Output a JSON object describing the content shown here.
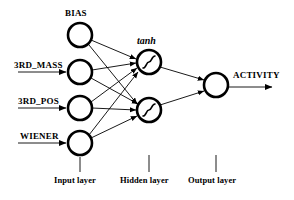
{
  "diagram": {
    "title_labels": {
      "bias": "BIAS",
      "tanh": "tanh",
      "activity": "ACTIVITY"
    },
    "inputs": [
      {
        "id": "bias",
        "label": "BIAS",
        "label_position": "above",
        "has_arrow": false,
        "cx": 80,
        "cy": 35
      },
      {
        "id": "3rd_mass",
        "label": "3RD_MASS",
        "label_position": "left",
        "has_arrow": true,
        "cx": 80,
        "cy": 72
      },
      {
        "id": "3rd_pos",
        "label": "3RD_POS",
        "label_position": "left",
        "has_arrow": true,
        "cx": 80,
        "cy": 108
      },
      {
        "id": "wiener",
        "label": "WIENER",
        "label_position": "left",
        "has_arrow": true,
        "cx": 80,
        "cy": 143
      }
    ],
    "hidden": [
      {
        "id": "h1",
        "activation": "tanh",
        "cx": 149,
        "cy": 62
      },
      {
        "id": "h2",
        "activation": "tanh",
        "cx": 149,
        "cy": 110
      }
    ],
    "output": [
      {
        "id": "out",
        "label": "ACTIVITY",
        "cx": 216,
        "cy": 85
      }
    ],
    "layer_captions": [
      {
        "id": "input-layer",
        "label": "Input layer",
        "x": 80,
        "tick_top": 155,
        "tick_bottom": 172
      },
      {
        "id": "hidden-layer",
        "label": "Hidden layer",
        "x": 149,
        "tick_top": 155,
        "tick_bottom": 172
      },
      {
        "id": "output-layer",
        "label": "Output layer",
        "x": 216,
        "tick_top": 155,
        "tick_bottom": 172
      }
    ],
    "connections": [
      {
        "from": "bias",
        "to": "h1"
      },
      {
        "from": "bias",
        "to": "h2"
      },
      {
        "from": "3rd_mass",
        "to": "h1"
      },
      {
        "from": "3rd_mass",
        "to": "h2"
      },
      {
        "from": "3rd_pos",
        "to": "h1"
      },
      {
        "from": "3rd_pos",
        "to": "h2"
      },
      {
        "from": "wiener",
        "to": "h1"
      },
      {
        "from": "wiener",
        "to": "h2"
      },
      {
        "from": "h1",
        "to": "out"
      },
      {
        "from": "h2",
        "to": "out"
      }
    ],
    "style": {
      "node_fill": "#ffffff",
      "node_stroke": "#000000",
      "edge_color": "#000000",
      "background": "#ffffff",
      "node_radius": 12,
      "node_stroke_width": 2.6,
      "edge_width": 0.9
    }
  }
}
